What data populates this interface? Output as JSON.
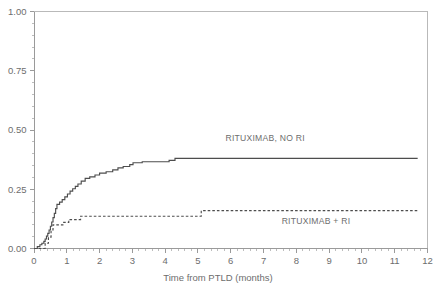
{
  "chart_data": {
    "type": "line",
    "subtype": "kaplan-meier-cumulative-incidence-step",
    "title": "",
    "xlabel": "Time from PTLD (months)",
    "ylabel": "",
    "xlim": [
      0,
      12
    ],
    "ylim": [
      0,
      1.0
    ],
    "grid": false,
    "legend_position": "inline-annotations",
    "xticks": [
      0,
      1,
      2,
      3,
      4,
      5,
      6,
      7,
      8,
      9,
      10,
      11,
      12
    ],
    "xticklabels": [
      "0",
      "1",
      "2",
      "3",
      "4",
      "5",
      "6",
      "7",
      "8",
      "9",
      "10",
      "11",
      "12"
    ],
    "x_minor_step": 0.2,
    "yticks": [
      0.0,
      0.25,
      0.5,
      0.75,
      1.0
    ],
    "yticklabels": [
      "0.00",
      "0.25",
      "0.50",
      "0.75",
      "1.00"
    ],
    "y_minor_step": 0.05,
    "series": [
      {
        "name": "RITUXIMAB, NO RI",
        "style": "solid",
        "color": "#4d4d4d",
        "label_x": 7.05,
        "label_y": 0.455,
        "plateau_value": 0.38,
        "end_x": 11.7,
        "points": [
          [
            0.0,
            0.0
          ],
          [
            0.1,
            0.0
          ],
          [
            0.1,
            0.008
          ],
          [
            0.18,
            0.008
          ],
          [
            0.18,
            0.016
          ],
          [
            0.24,
            0.016
          ],
          [
            0.24,
            0.022
          ],
          [
            0.3,
            0.022
          ],
          [
            0.3,
            0.03
          ],
          [
            0.34,
            0.03
          ],
          [
            0.34,
            0.04
          ],
          [
            0.38,
            0.04
          ],
          [
            0.38,
            0.052
          ],
          [
            0.42,
            0.052
          ],
          [
            0.42,
            0.064
          ],
          [
            0.46,
            0.064
          ],
          [
            0.46,
            0.078
          ],
          [
            0.5,
            0.078
          ],
          [
            0.5,
            0.094
          ],
          [
            0.54,
            0.094
          ],
          [
            0.54,
            0.112
          ],
          [
            0.58,
            0.112
          ],
          [
            0.58,
            0.13
          ],
          [
            0.62,
            0.13
          ],
          [
            0.62,
            0.148
          ],
          [
            0.66,
            0.148
          ],
          [
            0.66,
            0.168
          ],
          [
            0.7,
            0.168
          ],
          [
            0.7,
            0.186
          ],
          [
            0.78,
            0.186
          ],
          [
            0.78,
            0.196
          ],
          [
            0.86,
            0.196
          ],
          [
            0.86,
            0.206
          ],
          [
            0.94,
            0.206
          ],
          [
            0.94,
            0.218
          ],
          [
            1.02,
            0.218
          ],
          [
            1.02,
            0.23
          ],
          [
            1.1,
            0.23
          ],
          [
            1.1,
            0.242
          ],
          [
            1.18,
            0.242
          ],
          [
            1.18,
            0.252
          ],
          [
            1.26,
            0.252
          ],
          [
            1.26,
            0.262
          ],
          [
            1.34,
            0.262
          ],
          [
            1.34,
            0.272
          ],
          [
            1.44,
            0.272
          ],
          [
            1.44,
            0.284
          ],
          [
            1.56,
            0.284
          ],
          [
            1.56,
            0.296
          ],
          [
            1.7,
            0.296
          ],
          [
            1.7,
            0.302
          ],
          [
            1.86,
            0.302
          ],
          [
            1.86,
            0.31
          ],
          [
            2.0,
            0.31
          ],
          [
            2.0,
            0.318
          ],
          [
            2.2,
            0.318
          ],
          [
            2.2,
            0.324
          ],
          [
            2.4,
            0.324
          ],
          [
            2.4,
            0.332
          ],
          [
            2.56,
            0.332
          ],
          [
            2.56,
            0.34
          ],
          [
            2.72,
            0.34
          ],
          [
            2.72,
            0.346
          ],
          [
            2.92,
            0.346
          ],
          [
            2.92,
            0.354
          ],
          [
            3.02,
            0.354
          ],
          [
            3.02,
            0.362
          ],
          [
            3.3,
            0.362
          ],
          [
            3.3,
            0.366
          ],
          [
            4.12,
            0.366
          ],
          [
            4.12,
            0.372
          ],
          [
            4.3,
            0.372
          ],
          [
            4.3,
            0.38
          ],
          [
            11.7,
            0.38
          ]
        ]
      },
      {
        "name": "RITUXIMAB + RI",
        "style": "dashed",
        "color": "#4d4d4d",
        "label_x": 8.6,
        "label_y": 0.105,
        "plateau_value": 0.16,
        "end_x": 11.7,
        "points": [
          [
            0.0,
            0.0
          ],
          [
            0.34,
            0.0
          ],
          [
            0.34,
            0.022
          ],
          [
            0.44,
            0.022
          ],
          [
            0.44,
            0.048
          ],
          [
            0.52,
            0.048
          ],
          [
            0.52,
            0.078
          ],
          [
            0.58,
            0.078
          ],
          [
            0.58,
            0.1
          ],
          [
            0.88,
            0.1
          ],
          [
            0.88,
            0.11
          ],
          [
            1.06,
            0.11
          ],
          [
            1.06,
            0.122
          ],
          [
            1.42,
            0.122
          ],
          [
            1.42,
            0.136
          ],
          [
            5.1,
            0.136
          ],
          [
            5.1,
            0.16
          ],
          [
            11.7,
            0.16
          ]
        ]
      }
    ]
  },
  "axis": {
    "x_title": "Time from PTLD (months)"
  }
}
